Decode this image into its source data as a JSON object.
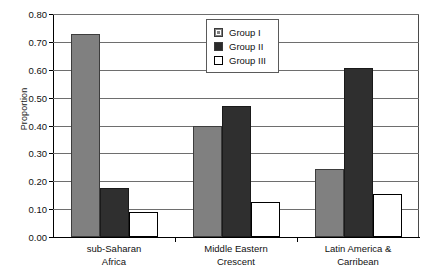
{
  "chart_data": {
    "type": "bar",
    "title": "",
    "xlabel": "",
    "ylabel": "Proportion",
    "ylim": [
      0.0,
      0.8
    ],
    "ytick_labels": [
      "0.00",
      "0.10",
      "0.20",
      "0.30",
      "0.40",
      "0.50",
      "0.60",
      "0.70",
      "0.80"
    ],
    "ytick_values": [
      0.0,
      0.1,
      0.2,
      0.3,
      0.4,
      0.5,
      0.6,
      0.7,
      0.8
    ],
    "grid": true,
    "legend_position": "top-center",
    "categories": [
      "sub-Saharan Africa",
      "Middle Eastern Crescent",
      "Latin America & Carribean"
    ],
    "category_lines": [
      [
        "sub-Saharan",
        "Africa"
      ],
      [
        "Middle Eastern",
        "Crescent"
      ],
      [
        "Latin America &",
        "Carribean"
      ]
    ],
    "series": [
      {
        "name": "Group I",
        "color": "#808080",
        "values": [
          0.73,
          0.4,
          0.245
        ]
      },
      {
        "name": "Group II",
        "color": "#2f2f2f",
        "values": [
          0.175,
          0.47,
          0.605
        ]
      },
      {
        "name": "Group III",
        "color": "#ffffff",
        "values": [
          0.09,
          0.125,
          0.155
        ]
      }
    ]
  },
  "legend": {
    "items": [
      {
        "label": "Group I"
      },
      {
        "label": "Group II"
      },
      {
        "label": "Group III"
      }
    ]
  }
}
